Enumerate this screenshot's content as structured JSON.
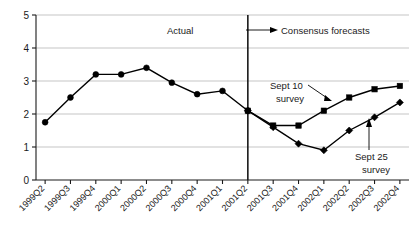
{
  "chart_data": {
    "type": "line",
    "title": "",
    "xlabel": "",
    "ylabel": "",
    "ylim": [
      0,
      5
    ],
    "yticks": [
      0,
      1,
      2,
      3,
      4,
      5
    ],
    "grid": true,
    "legend_position": "inline-annotations",
    "categories": [
      "1999Q2",
      "1999Q3",
      "1999Q4",
      "2000Q1",
      "2000Q2",
      "2000Q3",
      "2000Q4",
      "2001Q1",
      "2001Q2",
      "2001Q3",
      "2001Q4",
      "2002Q1",
      "2002Q2",
      "2002Q3",
      "2002Q4"
    ],
    "series": [
      {
        "name": "Actual",
        "marker": "circle",
        "x": [
          "1999Q2",
          "1999Q3",
          "1999Q4",
          "2000Q1",
          "2000Q2",
          "2000Q3",
          "2000Q4",
          "2001Q1",
          "2001Q2"
        ],
        "values": [
          1.75,
          2.5,
          3.2,
          3.2,
          3.4,
          2.95,
          2.6,
          2.7,
          2.1
        ]
      },
      {
        "name": "Sept 10 survey",
        "marker": "square",
        "x": [
          "2001Q2",
          "2001Q3",
          "2001Q4",
          "2002Q1",
          "2002Q2",
          "2002Q3",
          "2002Q4"
        ],
        "values": [
          2.1,
          1.65,
          1.65,
          2.1,
          2.5,
          2.75,
          2.85
        ]
      },
      {
        "name": "Sept 25 survey",
        "marker": "diamond",
        "x": [
          "2001Q2",
          "2001Q3",
          "2001Q4",
          "2002Q1",
          "2002Q2",
          "2002Q3",
          "2002Q4"
        ],
        "values": [
          2.1,
          1.6,
          1.1,
          0.9,
          1.5,
          1.9,
          2.35
        ]
      }
    ],
    "annotations": [
      {
        "id": "actual-label",
        "text": "Actual"
      },
      {
        "id": "consensus-label",
        "text": "Consensus forecasts"
      },
      {
        "id": "sept10-label-line1",
        "text": "Sept 10"
      },
      {
        "id": "sept10-label-line2",
        "text": "survey"
      },
      {
        "id": "sept25-label-line1",
        "text": "Sept 25"
      },
      {
        "id": "sept25-label-line2",
        "text": "survey"
      }
    ],
    "divider": {
      "at_category": "2001Q2",
      "note": "separates actual from forecast"
    }
  },
  "ytick_labels": [
    "5",
    "4",
    "3",
    "2",
    "1",
    "0"
  ],
  "xtick_labels": [
    "1999Q2",
    "1999Q3",
    "1999Q4",
    "2000Q1",
    "2000Q2",
    "2000Q3",
    "2000Q4",
    "2001Q1",
    "2001Q2",
    "2001Q3",
    "2001Q4",
    "2002Q1",
    "2002Q2",
    "2002Q3",
    "2002Q4"
  ],
  "labels": {
    "actual": "Actual",
    "consensus": "Consensus forecasts",
    "sept10_line1": "Sept 10",
    "sept10_line2": "survey",
    "sept25_line1": "Sept 25",
    "sept25_line2": "survey"
  },
  "colors": {
    "ink": "#000000",
    "grid": "#b6b6b6",
    "background": "#ffffff"
  }
}
